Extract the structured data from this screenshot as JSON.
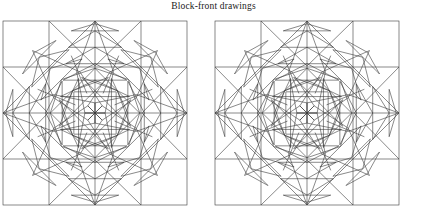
{
  "figure": {
    "caption": "Block-front drawings",
    "line_color": "#3b3b3b",
    "background_color": "#ffffff",
    "stroke_width": 0.6,
    "block_count": 2,
    "block_label_1": "quilt-block-left",
    "block_label_2": "quilt-block-right"
  },
  "chart_data": {
    "type": "diagram",
    "title": "Block-front drawings",
    "blocks": [
      {
        "name": "quilt-block-left",
        "origin_x": 3,
        "origin_y": 21,
        "size": 184,
        "grid": 4,
        "cell": 46,
        "center_x": 95,
        "center_y": 113
      },
      {
        "name": "quilt-block-right",
        "origin_x": 215,
        "origin_y": 21,
        "size": 184,
        "grid": 4,
        "cell": 46,
        "center_x": 307,
        "center_y": 113
      }
    ],
    "geometry": {
      "outer_border": true,
      "grid_lines": [
        0,
        0.25,
        0.5,
        0.75,
        1.0
      ],
      "corner_diagonals": 4,
      "star_points": 8,
      "feather_spikes_per_arm": 5
    }
  }
}
